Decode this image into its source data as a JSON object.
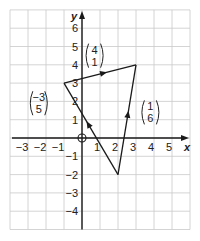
{
  "diagram": {
    "type": "coordinate-grid-vector-triangle",
    "x_axis": {
      "label": "x",
      "range": [
        -4,
        6
      ],
      "ticks": [
        -3,
        -2,
        -1,
        1,
        2,
        3,
        4,
        5
      ],
      "tick_labels": [
        "−3",
        "−2",
        "−1",
        "1",
        "2",
        "3",
        "4",
        "5"
      ]
    },
    "y_axis": {
      "label": "y",
      "range": [
        -5,
        7
      ],
      "ticks": [
        -4,
        -3,
        -2,
        -1,
        1,
        2,
        3,
        4,
        5,
        6
      ],
      "tick_labels": [
        "−4",
        "−3",
        "−2",
        "−1",
        "1",
        "2",
        "3",
        "4",
        "5",
        "6"
      ]
    },
    "origin_marker": "circle",
    "vertices": [
      {
        "name": "A",
        "x": -1,
        "y": 3
      },
      {
        "name": "B",
        "x": 3,
        "y": 4
      },
      {
        "name": "C",
        "x": 2,
        "y": -2
      }
    ],
    "vectors": [
      {
        "name": "vector-c-to-a",
        "from": [
          2,
          -2
        ],
        "to": [
          -1,
          3
        ],
        "label_top": "−3",
        "label_bottom": "5",
        "label_at": [
          -2.4,
          1.9
        ]
      },
      {
        "name": "vector-a-to-b",
        "from": [
          -1,
          3
        ],
        "to": [
          3,
          4
        ],
        "label_top": "4",
        "label_bottom": "1",
        "label_at": [
          0.7,
          4.5
        ]
      },
      {
        "name": "vector-c-to-b",
        "from": [
          2,
          -2
        ],
        "to": [
          3,
          4
        ],
        "label_top": "1",
        "label_bottom": "6",
        "label_at": [
          3.8,
          1.4
        ]
      }
    ],
    "colors": {
      "grid": "#c9c9c9",
      "ink": "#1a1a1a"
    }
  }
}
